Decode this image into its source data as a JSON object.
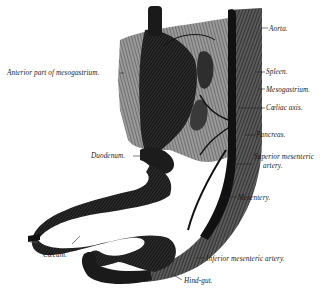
{
  "figure": {
    "type": "anatomical-illustration",
    "colors": {
      "ink": "#1a1a1a",
      "shade": "#3a3a3a",
      "mid": "#777777",
      "light": "#bdbdbd",
      "paper": "#ffffff"
    }
  },
  "labels": {
    "aorta": "Aorta.",
    "anterior_mesogastrium": "Anterior part of mesogastrium.",
    "spleen": "Spleen.",
    "mesogastrium": "Mesogastrium.",
    "coeliac_axis": "Cœliac axis.",
    "pancreas": "Pancreas.",
    "duodenum": "Duodenum.",
    "superior_mesenteric_1": "Superior mesenteric",
    "superior_mesenteric_2": "artery.",
    "mesentery": "Mesentery.",
    "caecum": "Cæcum.",
    "inferior_mesenteric": "Inferior mesenteric artery.",
    "hind_gut": "Hind-gut."
  }
}
